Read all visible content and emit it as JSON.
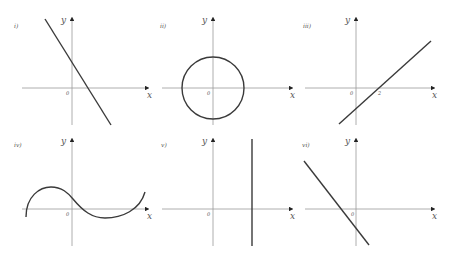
{
  "panels": [
    {
      "label": "i)",
      "x_label": "x",
      "y_label": "y",
      "origin": "0",
      "kind": "line",
      "description": "straight line with negative gradient, positive y-intercept"
    },
    {
      "label": "ii)",
      "x_label": "x",
      "y_label": "y",
      "origin": "0",
      "kind": "circle",
      "description": "circle centred at origin"
    },
    {
      "label": "iii)",
      "x_label": "x",
      "y_label": "y",
      "origin": "0",
      "tick": "2",
      "kind": "line",
      "description": "straight line with positive gradient crossing x-axis at 2"
    },
    {
      "label": "iv)",
      "x_label": "x",
      "y_label": "y",
      "origin": "0",
      "kind": "cubic",
      "description": "cubic-like curve"
    },
    {
      "label": "v)",
      "x_label": "x",
      "y_label": "y",
      "origin": "0",
      "kind": "vertical-line",
      "description": "vertical line x = constant > 0"
    },
    {
      "label": "vi)",
      "x_label": "x",
      "y_label": "y",
      "origin": "0",
      "kind": "line",
      "description": "straight line with negative gradient, negative y-intercept"
    }
  ],
  "colors": {
    "axis": "#9a9a9a",
    "curve": "#3a3a3a"
  }
}
